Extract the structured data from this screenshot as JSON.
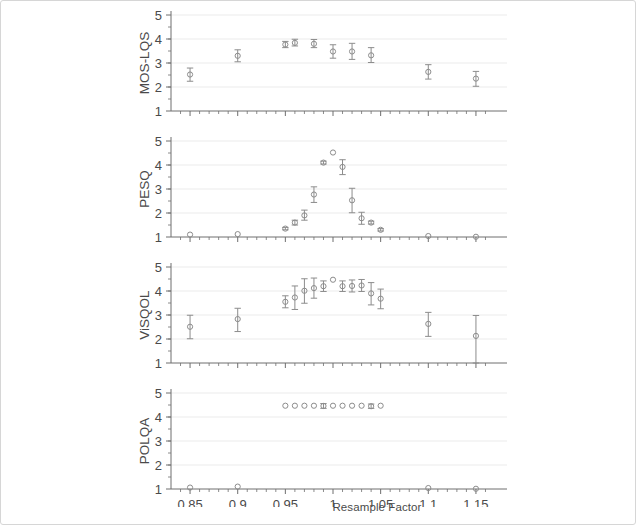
{
  "figure": {
    "background_color": "#ffffff",
    "frame_color": "#d6d6d6",
    "marker_color": "#8c8c8c",
    "axis_color": "#6e6e6e",
    "grid_color": "#ebebeb",
    "tick_label_color": "#4a4a4a"
  },
  "axis": {
    "x_title": "Resample Factor",
    "x_ticks": [
      "0.85",
      "0.9",
      "0.95",
      "1",
      "1.05",
      "1.1",
      "1.15"
    ],
    "x_tick_values": [
      0.85,
      0.9,
      0.95,
      1,
      1.05,
      1.1,
      1.15
    ],
    "x_min": 0.83,
    "x_max": 1.17,
    "y_ticks": [
      "1",
      "2",
      "3",
      "4",
      "5"
    ],
    "y_tick_values": [
      1,
      2,
      3,
      4,
      5
    ],
    "y_min": 1,
    "y_max": 5
  },
  "panels": [
    {
      "label": "MOS-LQS"
    },
    {
      "label": "PESQ"
    },
    {
      "label": "ViSQOL"
    },
    {
      "label": "POLQA"
    }
  ],
  "chart_data": [
    {
      "type": "scatter",
      "title": "MOS-LQS",
      "xlabel": "Resample Factor",
      "ylabel": "MOS-LQS",
      "xlim": [
        0.83,
        1.17
      ],
      "ylim": [
        1,
        5
      ],
      "grid": true,
      "legend": "none",
      "x": [
        0.85,
        0.9,
        0.95,
        0.96,
        0.98,
        1.0,
        1.02,
        1.04,
        1.1,
        1.15
      ],
      "values": [
        2.52,
        3.3,
        3.77,
        3.84,
        3.8,
        3.48,
        3.48,
        3.32,
        2.63,
        2.35
      ],
      "err_low": [
        0.28,
        0.25,
        0.13,
        0.13,
        0.16,
        0.28,
        0.33,
        0.3,
        0.3,
        0.32
      ],
      "err_high": [
        0.27,
        0.25,
        0.13,
        0.15,
        0.18,
        0.28,
        0.34,
        0.32,
        0.3,
        0.3
      ]
    },
    {
      "type": "scatter",
      "title": "PESQ",
      "xlabel": "Resample Factor",
      "ylabel": "PESQ",
      "xlim": [
        0.83,
        1.17
      ],
      "ylim": [
        1,
        5
      ],
      "grid": true,
      "legend": "none",
      "x": [
        0.85,
        0.9,
        0.95,
        0.96,
        0.97,
        0.98,
        0.99,
        1.0,
        1.01,
        1.02,
        1.03,
        1.04,
        1.05,
        1.1,
        1.15
      ],
      "values": [
        1.1,
        1.12,
        1.35,
        1.6,
        1.9,
        2.77,
        4.1,
        4.52,
        3.92,
        2.53,
        1.78,
        1.6,
        1.3,
        1.04,
        1.01
      ],
      "err_low": [
        0.04,
        0.04,
        0.05,
        0.1,
        0.2,
        0.33,
        0.06,
        0.03,
        0.32,
        0.52,
        0.25,
        0.06,
        0.05,
        0.02,
        0.01
      ],
      "err_high": [
        0.04,
        0.04,
        0.05,
        0.1,
        0.22,
        0.32,
        0.06,
        0.03,
        0.3,
        0.5,
        0.25,
        0.06,
        0.05,
        0.02,
        0.01
      ]
    },
    {
      "type": "scatter",
      "title": "ViSQOL",
      "xlabel": "Resample Factor",
      "ylabel": "ViSQOL",
      "xlim": [
        0.83,
        1.17
      ],
      "ylim": [
        1,
        5
      ],
      "grid": true,
      "legend": "none",
      "x": [
        0.85,
        0.9,
        0.95,
        0.96,
        0.97,
        0.98,
        0.99,
        1.0,
        1.01,
        1.02,
        1.03,
        1.04,
        1.05,
        1.1,
        1.15
      ],
      "values": [
        2.51,
        2.83,
        3.55,
        3.73,
        4.01,
        4.12,
        4.2,
        4.47,
        4.2,
        4.21,
        4.23,
        3.9,
        3.68,
        2.63,
        2.13
      ],
      "err_low": [
        0.5,
        0.52,
        0.25,
        0.5,
        0.52,
        0.42,
        0.22,
        0.04,
        0.22,
        0.25,
        0.25,
        0.48,
        0.42,
        0.52,
        1.13
      ],
      "err_high": [
        0.48,
        0.45,
        0.25,
        0.48,
        0.5,
        0.42,
        0.22,
        0.04,
        0.22,
        0.25,
        0.25,
        0.45,
        0.4,
        0.48,
        0.85
      ]
    },
    {
      "type": "scatter",
      "title": "POLQA",
      "xlabel": "Resample Factor",
      "ylabel": "POLQA",
      "xlim": [
        0.83,
        1.17
      ],
      "ylim": [
        1,
        5
      ],
      "grid": true,
      "legend": "none",
      "x": [
        0.85,
        0.9,
        0.95,
        0.96,
        0.97,
        0.98,
        0.99,
        1.0,
        1.01,
        1.02,
        1.03,
        1.04,
        1.05,
        1.1,
        1.15
      ],
      "values": [
        1.06,
        1.1,
        4.47,
        4.47,
        4.47,
        4.47,
        4.46,
        4.47,
        4.47,
        4.47,
        4.47,
        4.45,
        4.47,
        1.04,
        1.01
      ],
      "err_low": [
        0.03,
        0.04,
        0.02,
        0.02,
        0.02,
        0.02,
        0.1,
        0.02,
        0.02,
        0.02,
        0.02,
        0.09,
        0.02,
        0.03,
        0.01
      ],
      "err_high": [
        0.03,
        0.04,
        0.02,
        0.02,
        0.02,
        0.02,
        0.1,
        0.02,
        0.02,
        0.02,
        0.02,
        0.09,
        0.02,
        0.03,
        0.01
      ]
    }
  ]
}
